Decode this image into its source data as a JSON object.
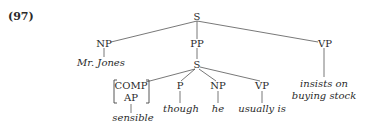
{
  "example_number": "(97)",
  "tree": {
    "root": {
      "label": "S",
      "children": [
        {
          "label": "NP",
          "leaf": "Mr. Jones"
        },
        {
          "label": "PP",
          "child": {
            "label": "S",
            "children": [
              {
                "label_lines": [
                  "COMP",
                  "AP"
                ],
                "bracketed": true,
                "leaf": "sensible"
              },
              {
                "label": "P",
                "leaf": "though"
              },
              {
                "label": "NP",
                "leaf": "he"
              },
              {
                "label": "VP",
                "leaf": "usually is"
              }
            ]
          }
        },
        {
          "label": "VP",
          "leaf_lines": [
            "insists on",
            "buying stock"
          ]
        }
      ]
    }
  },
  "colors": {
    "ink": "#2a2a2a",
    "background": "#ffffff"
  }
}
